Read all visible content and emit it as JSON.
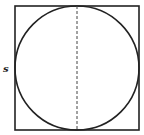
{
  "diagram": {
    "side_label": "s",
    "shapes": {
      "square": {
        "x": 15,
        "y": 6,
        "size": 124,
        "stroke": "#222222"
      },
      "circle": {
        "cx": 77,
        "cy": 68,
        "r": 62,
        "stroke": "#222222"
      },
      "diameter": {
        "x": 77,
        "y1": 6,
        "y2": 130,
        "style": "dashed",
        "stroke": "#444444"
      }
    }
  }
}
